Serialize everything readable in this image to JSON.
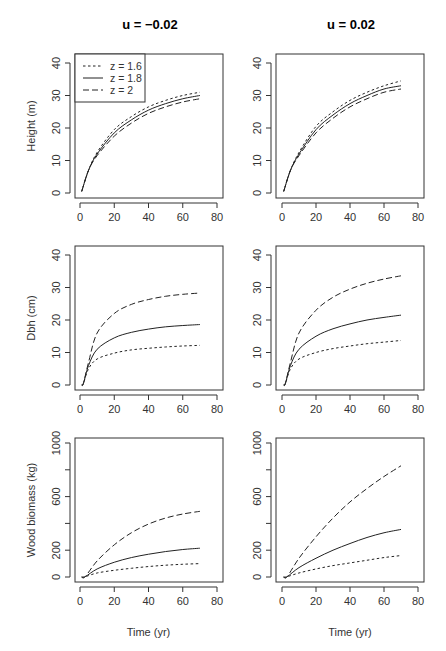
{
  "figure": {
    "columns": [
      {
        "title": "u = −0.02"
      },
      {
        "title": "u = 0.02"
      }
    ],
    "rows": [
      {
        "ylabel": "Height (m)",
        "yticks": [
          0,
          10,
          20,
          30,
          40
        ],
        "ylim": [
          0,
          42
        ]
      },
      {
        "ylabel": "Dbh (cm)",
        "yticks": [
          0,
          10,
          20,
          30,
          40
        ],
        "ylim": [
          0,
          42
        ]
      },
      {
        "ylabel": "Wood biomass (kg)",
        "yticks": [
          0,
          200,
          600,
          1000
        ],
        "yticks_unlabeled": [
          400,
          800
        ],
        "ylim": [
          0,
          1040
        ]
      }
    ],
    "xticks": [
      0,
      20,
      40,
      60,
      80
    ],
    "xlabel": "Time (yr)",
    "legend": [
      {
        "label": "z = 1.6",
        "style": "dotted"
      },
      {
        "label": "z = 1.8",
        "style": "solid"
      },
      {
        "label": "z = 2",
        "style": "dashed"
      }
    ]
  },
  "chart_data": [
    {
      "type": "line",
      "panel": "Height, u = -0.02",
      "title": "u = −0.02",
      "xlabel": "",
      "ylabel": "Height (m)",
      "xlim": [
        0,
        80
      ],
      "ylim": [
        0,
        40
      ],
      "x": [
        1,
        5,
        10,
        20,
        30,
        40,
        50,
        60,
        70
      ],
      "series": [
        {
          "name": "z = 1.6",
          "values": [
            0.5,
            7,
            12.5,
            19.5,
            23.5,
            26.5,
            28.5,
            30,
            31
          ]
        },
        {
          "name": "z = 1.8",
          "values": [
            0.5,
            7,
            12,
            18.5,
            22.5,
            25.5,
            27.5,
            29,
            30
          ]
        },
        {
          "name": "z = 2",
          "values": [
            0.5,
            7,
            11.5,
            17.5,
            21.5,
            24.5,
            26.5,
            28,
            29
          ]
        }
      ]
    },
    {
      "type": "line",
      "panel": "Height, u = 0.02",
      "title": "u = 0.02",
      "xlabel": "",
      "ylabel": "",
      "xlim": [
        0,
        80
      ],
      "ylim": [
        0,
        40
      ],
      "x": [
        1,
        5,
        10,
        20,
        30,
        40,
        50,
        60,
        70
      ],
      "series": [
        {
          "name": "z = 1.6",
          "values": [
            0.5,
            7,
            12.5,
            20.5,
            25,
            28.5,
            31,
            33,
            34.5
          ]
        },
        {
          "name": "z = 1.8",
          "values": [
            0.5,
            7,
            12,
            19.5,
            24,
            27.5,
            30,
            32,
            33
          ]
        },
        {
          "name": "z = 2",
          "values": [
            0.5,
            7,
            11.5,
            18.5,
            23,
            26.5,
            29,
            31,
            32
          ]
        }
      ]
    },
    {
      "type": "line",
      "panel": "Dbh, u = -0.02",
      "xlabel": "",
      "ylabel": "Dbh (cm)",
      "xlim": [
        0,
        80
      ],
      "ylim": [
        0,
        40
      ],
      "x": [
        1,
        2,
        5,
        10,
        20,
        30,
        40,
        50,
        60,
        70
      ],
      "series": [
        {
          "name": "z = 1.6",
          "values": [
            0,
            0.5,
            5,
            8,
            9.8,
            10.8,
            11.3,
            11.7,
            12,
            12.2
          ]
        },
        {
          "name": "z = 1.8",
          "values": [
            0,
            0.5,
            6,
            11,
            14.5,
            16.2,
            17.2,
            17.9,
            18.3,
            18.6
          ]
        },
        {
          "name": "z = 2",
          "values": [
            0,
            0.5,
            7,
            16,
            22,
            24.8,
            26.3,
            27.3,
            27.9,
            28.3
          ]
        }
      ]
    },
    {
      "type": "line",
      "panel": "Dbh, u = 0.02",
      "xlabel": "",
      "ylabel": "",
      "xlim": [
        0,
        80
      ],
      "ylim": [
        0,
        40
      ],
      "x": [
        1,
        2,
        5,
        10,
        20,
        30,
        40,
        50,
        60,
        70
      ],
      "series": [
        {
          "name": "z = 1.6",
          "values": [
            0,
            0.5,
            5,
            8,
            10,
            11.2,
            12,
            12.7,
            13.2,
            13.7
          ]
        },
        {
          "name": "z = 1.8",
          "values": [
            0,
            0.5,
            6,
            11,
            15,
            17.3,
            18.8,
            20,
            20.8,
            21.5
          ]
        },
        {
          "name": "z = 2",
          "values": [
            0,
            0.5,
            7,
            16,
            23,
            27,
            29.5,
            31.3,
            32.6,
            33.6
          ]
        }
      ]
    },
    {
      "type": "line",
      "panel": "Wood biomass, u = -0.02",
      "xlabel": "Time (yr)",
      "ylabel": "Wood biomass (kg)",
      "xlim": [
        0,
        80
      ],
      "ylim": [
        0,
        1000
      ],
      "x": [
        1,
        3,
        10,
        20,
        30,
        40,
        50,
        60,
        70
      ],
      "series": [
        {
          "name": "z = 1.6",
          "values": [
            0,
            2,
            30,
            50,
            65,
            78,
            88,
            95,
            100
          ]
        },
        {
          "name": "z = 1.8",
          "values": [
            0,
            2,
            60,
            110,
            145,
            170,
            190,
            205,
            215
          ]
        },
        {
          "name": "z = 2",
          "values": [
            0,
            2,
            120,
            240,
            330,
            395,
            440,
            470,
            490
          ]
        }
      ]
    },
    {
      "type": "line",
      "panel": "Wood biomass, u = 0.02",
      "xlabel": "Time (yr)",
      "ylabel": "",
      "xlim": [
        0,
        80
      ],
      "ylim": [
        0,
        1000
      ],
      "x": [
        1,
        3,
        10,
        20,
        30,
        40,
        50,
        60,
        70
      ],
      "series": [
        {
          "name": "z = 1.6",
          "values": [
            0,
            2,
            30,
            60,
            85,
            105,
            125,
            145,
            160
          ]
        },
        {
          "name": "z = 1.8",
          "values": [
            0,
            2,
            70,
            140,
            200,
            250,
            295,
            330,
            355
          ]
        },
        {
          "name": "z = 2",
          "values": [
            0,
            2,
            140,
            300,
            440,
            560,
            660,
            750,
            830
          ]
        }
      ]
    }
  ]
}
